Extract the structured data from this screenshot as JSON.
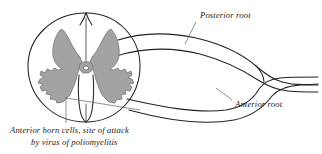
{
  "figure": {
    "background_color": "#ffffff",
    "ink_color": "#222222",
    "gray_matter_color": "#a3a3a3"
  },
  "labels": {
    "posterior_root": "Posterior root",
    "anterior_root": "Anterior root"
  },
  "caption": {
    "line1": "Anterior horn cells, site of attack",
    "line2": "by virus of poliomyelitis"
  },
  "structures": {
    "cord_outline": "spinal-cord-outline",
    "gray_matter": "butterfly-gray-matter",
    "central_canal": "central-canal",
    "posterior_median_sulcus": "posterior-median-sulcus",
    "anterior_median_fissure": "anterior-median-fissure",
    "posterior_root_fiber": "posterior-root",
    "anterior_root_fiber": "anterior-root",
    "spinal_nerve": "spinal-nerve-trunk"
  }
}
